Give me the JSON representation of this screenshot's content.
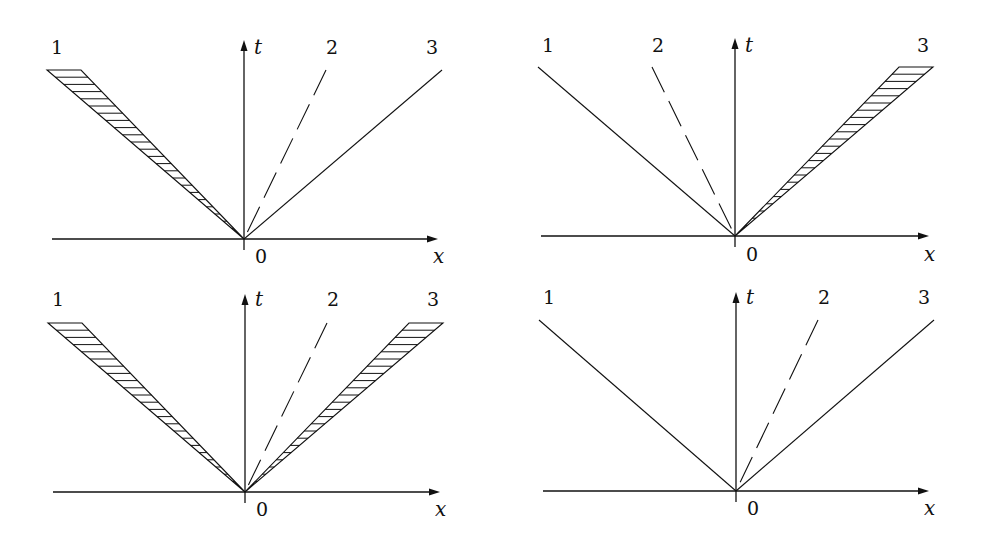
{
  "figure": {
    "panels": [
      {
        "id": "top-left",
        "axis_labels": {
          "t": "t",
          "x": "x",
          "origin": "0"
        },
        "rays": [
          {
            "label": "1",
            "side": "left",
            "style": "hatched"
          },
          {
            "label": "2",
            "side": "right-steep",
            "style": "dashed"
          },
          {
            "label": "3",
            "side": "right",
            "style": "solid"
          }
        ]
      },
      {
        "id": "top-right",
        "axis_labels": {
          "t": "t",
          "x": "x",
          "origin": "0"
        },
        "rays": [
          {
            "label": "1",
            "side": "left",
            "style": "solid"
          },
          {
            "label": "2",
            "side": "left-steep",
            "style": "dashed"
          },
          {
            "label": "3",
            "side": "right",
            "style": "hatched"
          }
        ]
      },
      {
        "id": "bottom-left",
        "axis_labels": {
          "t": "t",
          "x": "x",
          "origin": "0"
        },
        "rays": [
          {
            "label": "1",
            "side": "left",
            "style": "hatched"
          },
          {
            "label": "2",
            "side": "right-steep",
            "style": "dashed"
          },
          {
            "label": "3",
            "side": "right",
            "style": "hatched"
          }
        ]
      },
      {
        "id": "bottom-right",
        "axis_labels": {
          "t": "t",
          "x": "x",
          "origin": "0"
        },
        "rays": [
          {
            "label": "1",
            "side": "left",
            "style": "solid"
          },
          {
            "label": "2",
            "side": "right-steep",
            "style": "dashed"
          },
          {
            "label": "3",
            "side": "right",
            "style": "solid"
          }
        ]
      }
    ]
  }
}
